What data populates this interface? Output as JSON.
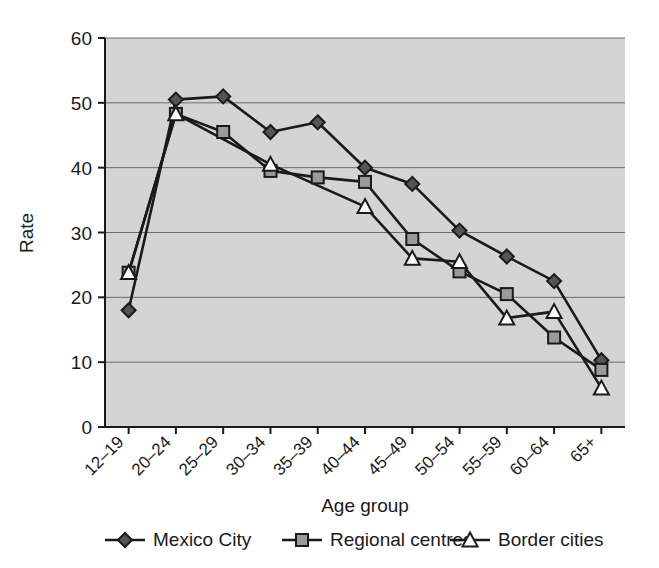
{
  "chart_data": {
    "type": "line",
    "title": "",
    "xlabel": "Age group",
    "ylabel": "Rate",
    "ylim": [
      0,
      60
    ],
    "yticks": [
      0,
      10,
      20,
      30,
      40,
      50,
      60
    ],
    "grid": true,
    "legend_position": "bottom",
    "plot_background": "#d4d4d4",
    "categories": [
      "12–19",
      "20–24",
      "25–29",
      "30–34",
      "35–39",
      "40–44",
      "45–49",
      "50–54",
      "55–59",
      "60–64",
      "65+"
    ],
    "series": [
      {
        "name": "Mexico City",
        "marker": "diamond",
        "marker_fill": "#555555",
        "line_color": "#1a1a1a",
        "values": [
          18.0,
          50.5,
          51.0,
          45.5,
          47.0,
          40.0,
          37.5,
          30.3,
          26.3,
          22.5,
          10.3
        ]
      },
      {
        "name": "Regional centres",
        "marker": "square",
        "marker_fill": "#9a9a9a",
        "line_color": "#1a1a1a",
        "values": [
          23.8,
          48.3,
          45.5,
          39.5,
          38.5,
          37.8,
          29.0,
          24.0,
          20.5,
          13.8,
          8.8
        ]
      },
      {
        "name": "Border cities",
        "marker": "triangle",
        "marker_fill": "#ffffff",
        "line_color": "#1a1a1a",
        "values": [
          23.8,
          48.3,
          null,
          40.5,
          null,
          34.0,
          26.0,
          25.5,
          16.8,
          17.8,
          6.0
        ]
      }
    ]
  },
  "axes": {
    "y_title": "Rate",
    "x_title": "Age group",
    "y_tick_labels": [
      "60",
      "50",
      "40",
      "30",
      "20",
      "10",
      "0"
    ],
    "x_tick_labels": [
      "12–19",
      "20–24",
      "25–29",
      "30–34",
      "35–39",
      "40–44",
      "45–49",
      "50–54",
      "55–59",
      "60–64",
      "65+"
    ]
  },
  "legend": {
    "items": [
      {
        "label": "Mexico City",
        "marker": "diamond"
      },
      {
        "label": "Regional centres",
        "marker": "square"
      },
      {
        "label": "Border cities",
        "marker": "triangle"
      }
    ]
  },
  "colors": {
    "plot_bg": "#d4d4d4",
    "grid": "#6b6b6b",
    "axis": "#1a1a1a",
    "series_1_fill": "#555555",
    "series_2_fill": "#9a9a9a",
    "series_3_fill": "#ffffff"
  }
}
